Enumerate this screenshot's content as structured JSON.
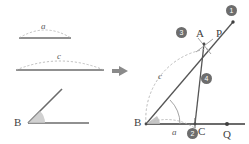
{
  "figure": {
    "colors": {
      "solid_line": "#6b6b6b",
      "dark_line": "#4a4a4a",
      "dashed_line": "#a9a9a9",
      "label_text": "#3f3f3f",
      "step_badge_fill": "#6d6d6d",
      "step_badge_text": "#ffffff",
      "angle_fill": "#c9c9c9",
      "background": "#ffffff"
    }
  },
  "given_panel": {
    "name": "given-parts",
    "items": [
      {
        "id": "given-segment-a",
        "label": "a",
        "kind": "segment",
        "note": "given side a with dashed arc above"
      },
      {
        "id": "given-segment-c",
        "label": "c",
        "kind": "segment",
        "note": "given side c with dashed arc above"
      },
      {
        "id": "given-angle-b",
        "label": "B",
        "kind": "angle",
        "note": "given angle at vertex B"
      }
    ]
  },
  "arrow": {
    "name": "transform-arrow",
    "glyph": "▶"
  },
  "construction_panel": {
    "name": "construction-result",
    "points": [
      {
        "id": "point-a",
        "label": "A"
      },
      {
        "id": "point-b",
        "label": "B"
      },
      {
        "id": "point-c",
        "label": "C"
      },
      {
        "id": "point-p",
        "label": "P"
      },
      {
        "id": "point-q",
        "label": "Q"
      }
    ],
    "segment_labels": [
      {
        "id": "side-c-label",
        "label": "c"
      },
      {
        "id": "side-a-label",
        "label": "a"
      }
    ],
    "steps": [
      {
        "id": "step-1",
        "label": "❶",
        "number": "1"
      },
      {
        "id": "step-2",
        "label": "❷",
        "number": "2"
      },
      {
        "id": "step-3",
        "label": "❸",
        "number": "3"
      },
      {
        "id": "step-4",
        "label": "❹",
        "number": "4"
      }
    ]
  }
}
